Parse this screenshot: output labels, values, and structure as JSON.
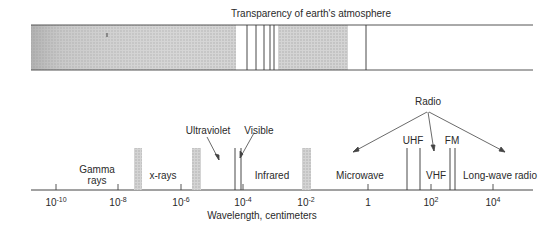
{
  "title": "Transparency of earth's atmosphere",
  "axis": {
    "label": "Wavelength, centimeters",
    "ticks": [
      {
        "base": "10",
        "exp": "-10",
        "x": 56
      },
      {
        "base": "10",
        "exp": "-8",
        "x": 118
      },
      {
        "base": "10",
        "exp": "-6",
        "x": 181
      },
      {
        "base": "10",
        "exp": "-4",
        "x": 243
      },
      {
        "base": "10",
        "exp": "-2",
        "x": 306
      },
      {
        "base": "1",
        "exp": "",
        "x": 368
      },
      {
        "base": "10",
        "exp": "2",
        "x": 431
      },
      {
        "base": "10",
        "exp": "4",
        "x": 493
      }
    ]
  },
  "regions": {
    "gamma": "Gamma rays",
    "gamma_line1": "Gamma",
    "gamma_line2": "rays",
    "xrays": "x-rays",
    "ultraviolet": "Ultraviolet",
    "visible": "Visible",
    "infrared": "Infrared",
    "microwave": "Microwave",
    "radio": "Radio",
    "uhf": "UHF",
    "vhf": "VHF",
    "fm": "FM",
    "longwave": "Long-wave radio"
  },
  "colors": {
    "line": "#3a3a3a",
    "opaque_fill": "#c8c8c8",
    "band_fill": "#c4c4c4"
  }
}
